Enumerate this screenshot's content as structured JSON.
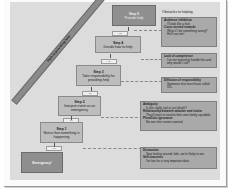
{
  "diagram": {
    "path_label": "Path to providing help",
    "steps": [
      {
        "title": "Emergency!",
        "desc": ""
      },
      {
        "title": "Step 1",
        "desc": "Notice that something is happening"
      },
      {
        "title": "Step 2",
        "desc": "Interpret event as an emergency"
      },
      {
        "title": "Step 3",
        "desc": "Take responsibility for providing help"
      },
      {
        "title": "Step 4",
        "desc": "Decide how to help"
      },
      {
        "title": "Step 5",
        "desc": "Provide help"
      }
    ],
    "connector_label": "Yes",
    "obstacles_title": "Obstacles to helping",
    "obstacles": [
      {
        "items": [
          {
            "heading": "Audience inhibition",
            "desc": "I'll look like a fool."
          },
          {
            "heading": "Costs exceed rewards",
            "desc": "What if I do something wrong? He'll sue me!"
          }
        ]
      },
      {
        "items": [
          {
            "heading": "Lack of competence",
            "desc": "I've not trained to handle this and why would I call?"
          }
        ]
      },
      {
        "items": [
          {
            "heading": "Diffusion of responsibility",
            "desc": "Someone else must have called 911."
          }
        ]
      },
      {
        "items": [
          {
            "heading": "Ambiguity",
            "desc": "Is this really real or just drunk?"
          },
          {
            "heading": "Relationship between attacker and victim",
            "desc": "They'll want to resolve their own family squabble."
          },
          {
            "heading": "Pluralistic ignorance",
            "desc": "No one else seems worried."
          }
        ]
      },
      {
        "items": [
          {
            "heading": "Distraction",
            "desc": "Stop fooling around, kids, we're likely to win."
          },
          {
            "heading": "Self-concerns",
            "desc": "I'm late for a very important date."
          }
        ]
      }
    ]
  }
}
